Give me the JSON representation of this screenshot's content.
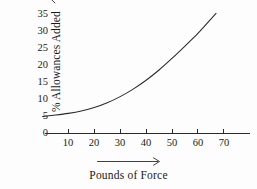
{
  "chart_data": {
    "type": "line",
    "title": "",
    "subtitle": "",
    "xlabel": "Pounds of Force",
    "ylabel": "% Allowances Added",
    "ylabel_arrow": "up-arrow",
    "xlabel_arrow": "right-arrow",
    "xlim": [
      0,
      74
    ],
    "ylim": [
      0,
      36.5
    ],
    "xticks": [
      10,
      20,
      30,
      40,
      50,
      60,
      70
    ],
    "yticks": [
      0,
      5,
      10,
      15,
      20,
      25,
      30,
      35
    ],
    "grid": false,
    "legend": null,
    "axis_style": {
      "x_axis_line": true,
      "y_axis_line": false,
      "tick_direction": "up",
      "line_color": "#2b2b2b",
      "curve_color": "#2b2b2b"
    },
    "series": [
      {
        "name": "Allowances vs Force",
        "x": [
          0,
          5,
          10,
          15,
          20,
          25,
          30,
          35,
          40,
          45,
          50,
          55,
          60,
          65,
          67
        ],
        "y": [
          5.0,
          5.4,
          5.9,
          6.6,
          7.6,
          9.0,
          10.8,
          13.0,
          15.6,
          18.6,
          22.0,
          25.6,
          29.3,
          33.5,
          35.2
        ]
      }
    ]
  },
  "figure": {
    "background": "#fdfdfd",
    "ink": "#1a1a1a"
  }
}
